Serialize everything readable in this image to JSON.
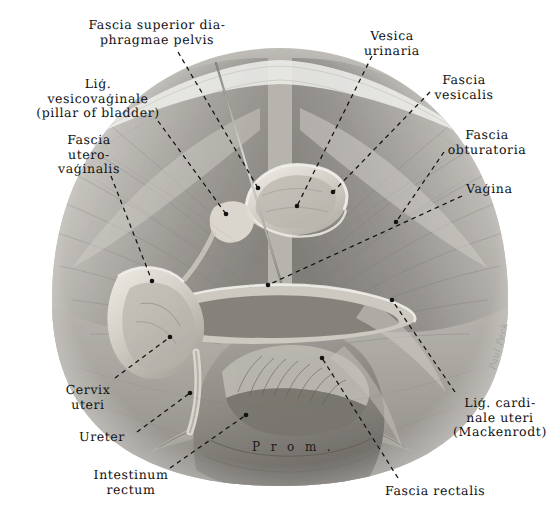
{
  "plate": {
    "title": "Female pelvis — endopelvic fascia, coronal view",
    "width": 560,
    "height": 526,
    "background": "#ffffff",
    "ink": "#121212",
    "leader_style": "dashed",
    "signature": "Paul Peck"
  },
  "center_annotation": {
    "name": "promontorium",
    "text": "P r o m ."
  },
  "labels": [
    {
      "id": "fascia-superior-diaphragmae-pelvis",
      "lines": [
        "Fascia superior dia-",
        "phragmae pelvis"
      ],
      "align": "center",
      "x": 57,
      "y": 18,
      "w": 200
    },
    {
      "id": "lig-vesicovaginale",
      "lines": [
        "Liģ.",
        "vesicovaģinale",
        "(pillar of bladder)"
      ],
      "align": "center",
      "x": 18,
      "y": 77,
      "w": 160
    },
    {
      "id": "fascia-uterovaginalis",
      "lines": [
        "Fascia",
        "utero-",
        "vaģinalis"
      ],
      "align": "center",
      "x": 34,
      "y": 133,
      "w": 110
    },
    {
      "id": "vesica-urinaria",
      "lines": [
        "Vesica",
        "urinaria"
      ],
      "align": "center",
      "x": 337,
      "y": 29,
      "w": 110
    },
    {
      "id": "fascia-vesicalis",
      "lines": [
        "Fascia",
        "vesicalis"
      ],
      "align": "center",
      "x": 414,
      "y": 73,
      "w": 100
    },
    {
      "id": "fascia-obturatoria",
      "lines": [
        "Fascia",
        "obturatoria"
      ],
      "align": "center",
      "x": 432,
      "y": 128,
      "w": 110
    },
    {
      "id": "vagina",
      "lines": [
        "Vaģina"
      ],
      "align": "left",
      "x": 466,
      "y": 182,
      "w": 90
    },
    {
      "id": "cervix-uteri",
      "lines": [
        "Cervix",
        "uteri"
      ],
      "align": "center",
      "x": 48,
      "y": 383,
      "w": 80
    },
    {
      "id": "ureter",
      "lines": [
        "Ureter"
      ],
      "align": "left",
      "x": 79,
      "y": 430,
      "w": 80
    },
    {
      "id": "intestinum-rectum",
      "lines": [
        "Intestinum",
        "rectum"
      ],
      "align": "center",
      "x": 76,
      "y": 468,
      "w": 110
    },
    {
      "id": "lig-cardinale-uteri",
      "lines": [
        "Liģ. cardi-",
        "nale uteri",
        "(Mackenrodt)"
      ],
      "align": "center",
      "x": 440,
      "y": 396,
      "w": 120
    },
    {
      "id": "fascia-rectalis",
      "lines": [
        "Fascia rectalis"
      ],
      "align": "left",
      "x": 385,
      "y": 484,
      "w": 130
    }
  ],
  "leaders": [
    {
      "id": "leader-fascia-superior-diaphragmae-pelvis",
      "from": [
        178,
        52
      ],
      "to": [
        258,
        188
      ],
      "dot": true
    },
    {
      "id": "leader-lig-vesicovaginale",
      "from": [
        158,
        121
      ],
      "to": [
        226,
        214
      ],
      "dot": true
    },
    {
      "id": "leader-fascia-uterovaginalis",
      "from": [
        111,
        176
      ],
      "to": [
        152,
        281
      ],
      "dot": true
    },
    {
      "id": "leader-vesica-urinaria",
      "from": [
        372,
        56
      ],
      "to": [
        297,
        206
      ],
      "dot": true
    },
    {
      "id": "leader-fascia-vesicalis",
      "from": [
        430,
        92
      ],
      "to": [
        333,
        192
      ],
      "dot": true
    },
    {
      "id": "leader-fascia-obturatoria",
      "from": [
        444,
        152
      ],
      "to": [
        396,
        222
      ],
      "dot": true
    },
    {
      "id": "leader-vagina",
      "from": [
        462,
        196
      ],
      "to": [
        268,
        285
      ],
      "dot": true
    },
    {
      "id": "leader-cervix-uteri",
      "from": [
        115,
        378
      ],
      "to": [
        170,
        337
      ],
      "dot": true
    },
    {
      "id": "leader-ureter",
      "from": [
        137,
        432
      ],
      "to": [
        190,
        393
      ],
      "dot": true
    },
    {
      "id": "leader-intestinum-rectum",
      "from": [
        170,
        468
      ],
      "to": [
        246,
        415
      ],
      "dot": true
    },
    {
      "id": "leader-lig-cardinale-uteri",
      "from": [
        455,
        392
      ],
      "to": [
        392,
        300
      ],
      "dot": true
    },
    {
      "id": "leader-fascia-rectalis",
      "from": [
        398,
        478
      ],
      "to": [
        322,
        358
      ],
      "dot": true
    }
  ],
  "probe": {
    "id": "surgical-probe",
    "from": [
      216,
      63
    ],
    "to": [
      281,
      280
    ]
  },
  "anatomy_regions": [
    {
      "id": "pelvic-wall-left",
      "tone": "#9b9b9b"
    },
    {
      "id": "pelvic-wall-right",
      "tone": "#8f8f8f"
    },
    {
      "id": "bladder",
      "tone": "#d2cec7"
    },
    {
      "id": "cervix-uteri-body",
      "tone": "#cfcac2"
    },
    {
      "id": "vaginal-vault",
      "tone": "#9a968f"
    },
    {
      "id": "rectum",
      "tone": "#8b8882"
    },
    {
      "id": "sacral-promontory",
      "tone": "#b4b0aa"
    }
  ]
}
